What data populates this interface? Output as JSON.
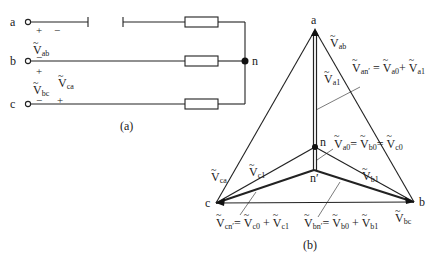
{
  "figure_a": {
    "caption": "(a)",
    "terminals": [
      "a",
      "b",
      "c"
    ],
    "node": "n",
    "voltages": [
      {
        "symbol": "V",
        "sub": "ab"
      },
      {
        "symbol": "V",
        "sub": "bc"
      },
      {
        "symbol": "V",
        "sub": "ca"
      }
    ],
    "signs": {
      "ab_plus": "+",
      "ab_minus": "−",
      "b_minus": "−",
      "bc_plus": "+",
      "bc_minus": "−",
      "ca_plus": "+"
    }
  },
  "figure_b": {
    "caption": "(b)",
    "vertices": {
      "a": "a",
      "b": "b",
      "c": "c",
      "n": "n",
      "n_prime": "n′"
    },
    "labels": {
      "Vab": {
        "symbol": "V",
        "sub": "ab"
      },
      "Vbc": {
        "symbol": "V",
        "sub": "bc"
      },
      "Vca": {
        "symbol": "V",
        "sub": "ca"
      },
      "Va1": {
        "symbol": "V",
        "sub": "a1"
      },
      "Vb1": {
        "symbol": "V",
        "sub": "b1"
      },
      "Vc1": {
        "symbol": "V",
        "sub": "c1"
      }
    },
    "equations": {
      "an": {
        "lhs": "an′",
        "t1": "a0",
        "t2": "a1"
      },
      "zero": {
        "t1": "a0",
        "t2": "b0",
        "t3": "c0"
      },
      "cn": {
        "lhs": "cn′",
        "t1": "c0",
        "t2": "c1"
      },
      "bn": {
        "lhs": "bn′",
        "t1": "b0",
        "t2": "b1"
      }
    }
  }
}
